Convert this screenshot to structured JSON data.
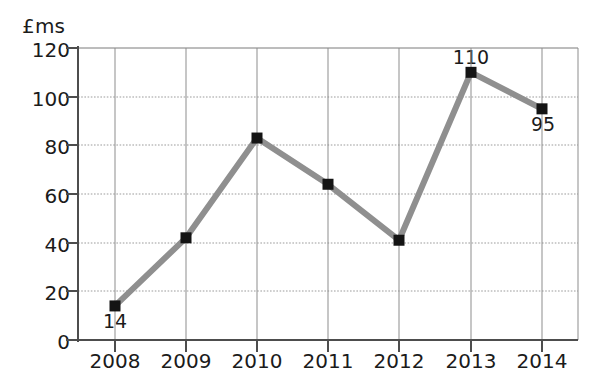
{
  "chart_data": {
    "type": "line",
    "title": "",
    "subtitle": "",
    "xlabel": "",
    "ylabel": "£ms",
    "categories": [
      "2008",
      "2009",
      "2010",
      "2011",
      "2012",
      "2013",
      "2014"
    ],
    "values": [
      14,
      42,
      83,
      64,
      41,
      110,
      95
    ],
    "series": [
      {
        "name": "",
        "values": [
          14,
          42,
          83,
          64,
          41,
          110,
          95
        ]
      }
    ],
    "point_labels": [
      {
        "category": "2008",
        "value": 14,
        "text": "14",
        "position": "below"
      },
      {
        "category": "2009",
        "value": 42,
        "text": "",
        "position": "none"
      },
      {
        "category": "2010",
        "value": 83,
        "text": "",
        "position": "none"
      },
      {
        "category": "2011",
        "value": 64,
        "text": "",
        "position": "none"
      },
      {
        "category": "2012",
        "value": 41,
        "text": "",
        "position": "none"
      },
      {
        "category": "2013",
        "value": 110,
        "text": "110",
        "position": "above"
      },
      {
        "category": "2014",
        "value": 95,
        "text": "95",
        "position": "below"
      }
    ],
    "ylim": [
      0,
      120
    ],
    "yticks": [
      0,
      20,
      40,
      60,
      80,
      100,
      120
    ],
    "ytick_labels": [
      "0",
      "20",
      "40",
      "60",
      "80",
      "100",
      "120"
    ],
    "xtick_labels": [
      "2008",
      "2009",
      "2010",
      "2011",
      "2012",
      "2013",
      "2014"
    ],
    "grid": true,
    "grid_style": "dotted-horizontal-and-solid-vertical",
    "legend": false,
    "legend_position": "none",
    "colors": {
      "line": "#8f8f8f",
      "marker": "#141414",
      "axis": "#4d4d4d",
      "grid": "#9b9b9b",
      "text": "#1b1b1b",
      "background": "#ffffff"
    },
    "annotations": []
  },
  "axis": {
    "y_title": "£ms"
  }
}
